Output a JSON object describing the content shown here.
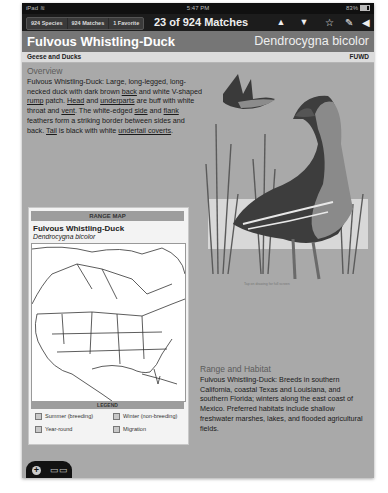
{
  "status_bar": {
    "device": "iPad",
    "wifi": "wifi-icon",
    "time": "5:47 PM",
    "battery": "83%"
  },
  "toolbar": {
    "segments": [
      "924 Species",
      "924 Matches",
      "1 Favorite"
    ],
    "match_count": "23 of 924 Matches",
    "icons": [
      "previous-arrow-icon",
      "next-arrow-icon",
      "favorite-star-icon",
      "edit-note-icon",
      "sound-speaker-icon"
    ]
  },
  "header": {
    "common_name": "Fulvous Whistling-Duck",
    "scientific_name": "Dendrocygna bicolor"
  },
  "subheader": {
    "family": "Geese and Ducks",
    "code": "FUWD"
  },
  "overview": {
    "title": "Overview",
    "parts": [
      "Fulvous Whistling-Duck: Large, long-legged, long-necked duck with dark brown ",
      "back",
      " and white V-shaped ",
      "rump",
      " patch. ",
      "Head",
      " and ",
      "underparts",
      " are buff with white throat and ",
      "vent",
      ". The white-edged ",
      "side",
      " and ",
      "flank",
      " feathers form a striking border between sides and back. ",
      "Tail",
      " is black with white ",
      "undertail coverts",
      "."
    ]
  },
  "illustration": {
    "caption": "Tap on drawing for full screen"
  },
  "range_map": {
    "heading": "RANGE MAP",
    "common_name": "Fulvous Whistling-Duck",
    "scientific_name": "Dendrocygna bicolor",
    "legend_heading": "LEGEND",
    "legend": [
      "Summer (breeding)",
      "Winter (non-breeding)",
      "Year-round",
      "Migration"
    ]
  },
  "range_habitat": {
    "title": "Range and Habitat",
    "text": "Fulvous Whistling-Duck: Breeds in southern California, coastal Texas and Louisiana, and southern Florida; winters along the east coast of Mexico. Preferred habitats include shallow freshwater marshes, lakes, and flooded agricultural fields."
  },
  "bottom_tab": {
    "add": "+",
    "book": "book-icon"
  }
}
